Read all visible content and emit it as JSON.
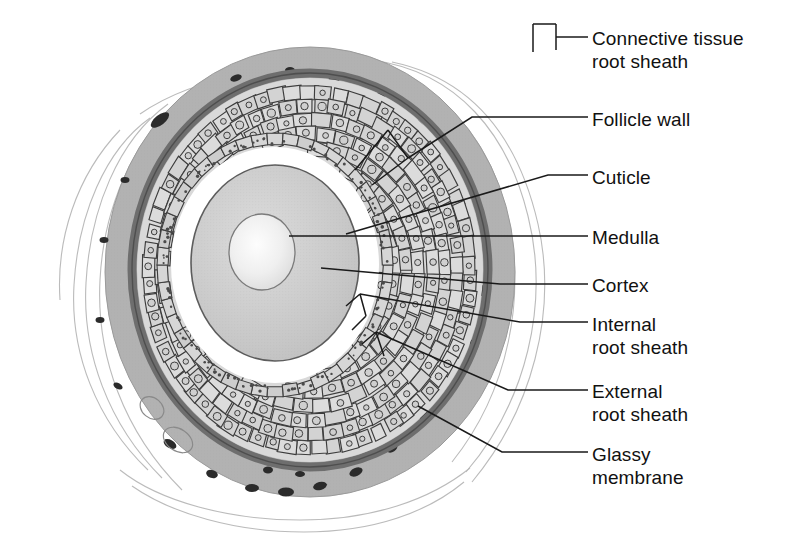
{
  "figure": {
    "kind": "anatomical-diagram",
    "background_color": "#ffffff",
    "line_color": "#1a1a1a"
  },
  "palette": {
    "outer_connective": "#b0b0b0",
    "connective_speckle": "#2e2e2e",
    "glassy_membrane": "#6f6f6f",
    "external_sheath": "#cbcbcb",
    "internal_sheath": "#d2d2d2",
    "cell_fill": "#d8d8d8",
    "cell_outline": "#3a3a3a",
    "cuticle": "#ffffff",
    "cortex": "#c9c9c9",
    "medulla_light": "#f7f7f7",
    "fiber_strand": "#a8a8a8"
  },
  "labels": [
    {
      "id": "connective-tissue-root-sheath",
      "line1": "Connective tissue",
      "line2": "root sheath",
      "x": 592,
      "y": 27
    },
    {
      "id": "follicle-wall",
      "line1": "Follicle wall",
      "line2": "",
      "x": 592,
      "y": 108
    },
    {
      "id": "cuticle",
      "line1": "Cuticle",
      "line2": "",
      "x": 592,
      "y": 166
    },
    {
      "id": "medulla",
      "line1": "Medulla",
      "line2": "",
      "x": 592,
      "y": 226
    },
    {
      "id": "cortex",
      "line1": "Cortex",
      "line2": "",
      "x": 592,
      "y": 274
    },
    {
      "id": "internal-root-sheath",
      "line1": "Internal",
      "line2": "root sheath",
      "x": 592,
      "y": 313
    },
    {
      "id": "external-root-sheath",
      "line1": "External",
      "line2": "root sheath",
      "x": 592,
      "y": 380
    },
    {
      "id": "glassy-membrane",
      "line1": "Glassy",
      "line2": "membrane",
      "x": 592,
      "y": 443
    }
  ],
  "structures": [
    {
      "id": "connective-tissue-root-sheath",
      "description": "outermost mottled gray band with dark nuclei specks and wispy fibers"
    },
    {
      "id": "follicle-wall",
      "description": "full thickness of sheath layers from glassy membrane inward"
    },
    {
      "id": "glassy-membrane",
      "description": "thin dark gray ring between connective tissue and external root sheath"
    },
    {
      "id": "external-root-sheath",
      "description": "broad zone of large pale polygonal cells with round nuclei"
    },
    {
      "id": "internal-root-sheath",
      "description": "inner zone of smaller cells and an elongated flattened cell layer"
    },
    {
      "id": "cuticle",
      "description": "thin white ring immediately surrounding the cortex"
    },
    {
      "id": "cortex",
      "description": "large stippled gray oval of the hair shaft"
    },
    {
      "id": "medulla",
      "description": "pale circular core at the center of the hair shaft"
    }
  ],
  "leaders": [
    {
      "id": "leader-connective-tissue",
      "points": "592,37 555,37 555,27 555,40"
    },
    {
      "id": "leader-follicle-wall",
      "points": "592,117 470,117 410,155"
    },
    {
      "id": "leader-cuticle",
      "points": "592,175 545,175 348,232"
    },
    {
      "id": "leader-medulla",
      "points": "592,236 290,236"
    },
    {
      "id": "leader-cortex",
      "points": "592,284 500,284 322,268"
    },
    {
      "id": "leader-internal-root-sheath",
      "points": "592,322 520,322 362,292"
    },
    {
      "id": "leader-external-root-sheath",
      "points": "592,390 505,390 378,330"
    },
    {
      "id": "leader-glassy-membrane",
      "points": "592,452 500,452 420,408"
    }
  ]
}
